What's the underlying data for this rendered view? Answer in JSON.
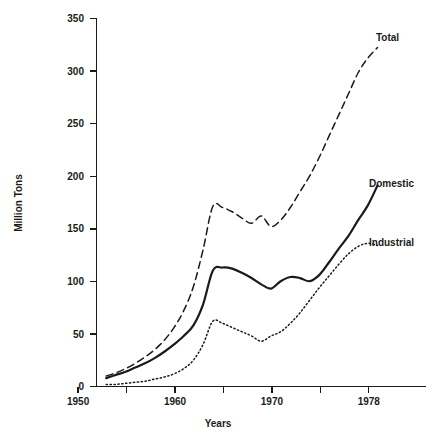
{
  "chart_data": {
    "type": "line",
    "title": "",
    "xlabel": "Years",
    "ylabel": "Million Tons",
    "xlim": [
      1949,
      1983
    ],
    "ylim": [
      0,
      350
    ],
    "grid": false,
    "legend_position": "right-inline-labels",
    "x_ticks": [
      1950,
      1955,
      1960,
      1965,
      1970,
      1975,
      1980
    ],
    "x_tick_labels": [
      "1950",
      "",
      "1960",
      "",
      "1970",
      "",
      "1978"
    ],
    "x_tick_labels_shown": [
      "1950",
      "1960",
      "1970",
      "1978"
    ],
    "y_ticks": [
      0,
      50,
      100,
      150,
      200,
      250,
      300,
      350
    ],
    "y_tick_labels": [
      "0",
      "50",
      "100",
      "150",
      "200",
      "250",
      "300",
      "350"
    ],
    "x": [
      1950,
      1951,
      1952,
      1953,
      1954,
      1955,
      1956,
      1957,
      1958,
      1959,
      1960,
      1961,
      1962,
      1963,
      1964,
      1965,
      1966,
      1967,
      1968,
      1969,
      1970,
      1971,
      1972,
      1973,
      1974,
      1975,
      1976,
      1977,
      1978
    ],
    "series": [
      {
        "name": "Total",
        "style": "dashed",
        "color": "#1a1a1a",
        "label_year": 1979,
        "values": [
          10,
          13,
          17,
          22,
          28,
          35,
          44,
          56,
          72,
          95,
          130,
          171,
          170,
          166,
          160,
          155,
          162,
          152,
          158,
          170,
          185,
          200,
          218,
          238,
          258,
          278,
          298,
          312,
          322
        ]
      },
      {
        "name": "Domestic",
        "style": "solid",
        "color": "#1a1a1a",
        "label_year": 1979,
        "values": [
          8,
          11,
          14,
          18,
          22,
          27,
          33,
          40,
          48,
          58,
          78,
          110,
          113,
          112,
          108,
          103,
          97,
          93,
          100,
          104,
          103,
          100,
          106,
          118,
          131,
          143,
          158,
          172,
          191
        ]
      },
      {
        "name": "Industrial",
        "style": "dotted",
        "color": "#1a1a1a",
        "label_year": 1979,
        "values": [
          2,
          2,
          3,
          4,
          5,
          7,
          9,
          12,
          17,
          25,
          40,
          62,
          60,
          56,
          52,
          48,
          43,
          48,
          52,
          60,
          70,
          82,
          94,
          105,
          116,
          126,
          133,
          136,
          134
        ]
      }
    ]
  },
  "labels": {
    "y_axis_title": "Million Tons",
    "x_axis_title": "Years",
    "series_total": "Total",
    "series_domestic": "Domestic",
    "series_industrial": "Industrial"
  },
  "tick_text": {
    "y": [
      "350",
      "300",
      "250",
      "200",
      "150",
      "100",
      "50",
      "0"
    ],
    "x": [
      "1950",
      "1960",
      "1970",
      "1978"
    ]
  }
}
